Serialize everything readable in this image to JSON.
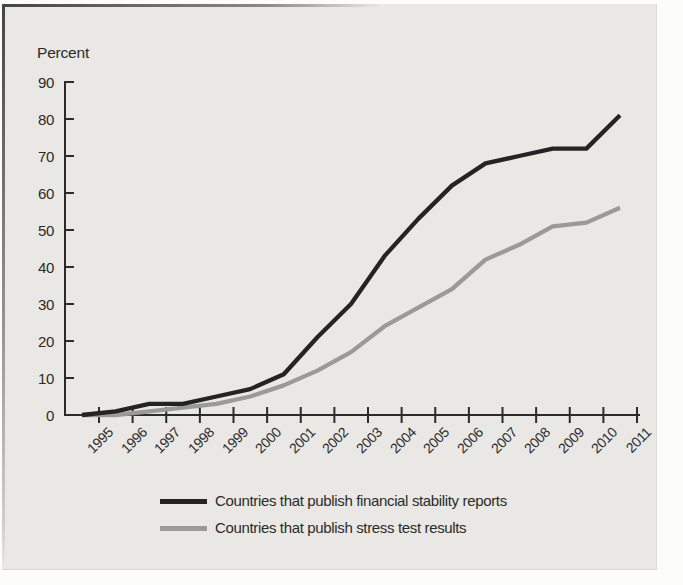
{
  "colors": {
    "panel_background": "#e9e8e4",
    "axis": "#2b2b2b",
    "text": "#2b2b2b"
  },
  "chart_data": {
    "type": "line",
    "title": "",
    "ylabel": "Percent",
    "xlabel": "",
    "ylim": [
      0,
      90
    ],
    "ytick_step": 10,
    "grid": false,
    "legend_position": "bottom",
    "x": [
      "1995",
      "1996",
      "1997",
      "1998",
      "1999",
      "2000",
      "2001",
      "2002",
      "2003",
      "2004",
      "2005",
      "2006",
      "2007",
      "2008",
      "2009",
      "2010",
      "2011"
    ],
    "series": [
      {
        "name": "Countries that publish financial stability reports",
        "color": "#242424",
        "values": [
          0,
          1,
          3,
          3,
          5,
          7,
          11,
          21,
          30,
          43,
          53,
          62,
          68,
          70,
          72,
          72,
          81
        ]
      },
      {
        "name": "Countries that publish stress test results",
        "color": "#9a9a98",
        "values": [
          0,
          0,
          1,
          2,
          3,
          5,
          8,
          12,
          17,
          24,
          29,
          34,
          42,
          46,
          51,
          52,
          56
        ]
      }
    ]
  }
}
